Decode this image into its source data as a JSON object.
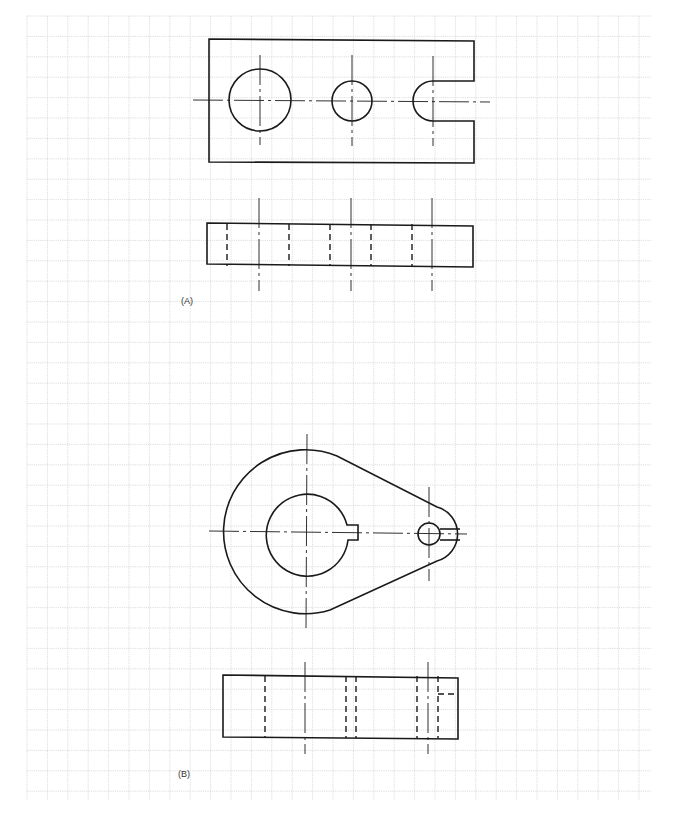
{
  "figure": {
    "labels": {
      "a": "(A)",
      "b": "(B)"
    },
    "grid": {
      "x0": 27,
      "y0": 16,
      "x1": 651,
      "y1": 800,
      "spacing": 20.4,
      "color": "#d4d4d4"
    },
    "line_color": "#1a1a1a",
    "view_a": {
      "top_view": {
        "outline": {
          "x": 209,
          "y": 39,
          "w": 265,
          "h": 124
        },
        "large_hole": {
          "cx": 260,
          "cy": 100,
          "r": 31
        },
        "medium_hole": {
          "cx": 352,
          "cy": 101,
          "r": 20
        },
        "u_slot": {
          "cx": 433,
          "cy": 101,
          "r": 20,
          "open_to_x": 474
        }
      },
      "front_view": {
        "outline": {
          "x": 207,
          "y": 223,
          "w": 266,
          "h": 43
        },
        "hidden_lines_x": [
          227,
          289,
          330,
          371,
          412
        ],
        "center_lines_x": [
          259,
          351,
          432
        ]
      }
    },
    "view_b": {
      "top_view": {
        "main_boss": {
          "cx": 307,
          "cy": 532,
          "r": 82
        },
        "bore": {
          "cx": 307,
          "cy": 532,
          "r": 41
        },
        "keyway": {
          "x": 348,
          "y": 526,
          "w": 10,
          "h": 14
        },
        "small_boss": {
          "cx": 429,
          "cy": 534,
          "r": 30
        },
        "small_hole": {
          "cx": 429,
          "cy": 534,
          "r": 11
        },
        "slit_y": [
          529,
          540
        ]
      },
      "front_view": {
        "outline": {
          "x": 223,
          "y": 675,
          "w": 235,
          "h": 63
        },
        "hidden_lines_x": [
          265,
          346,
          356,
          417,
          438
        ],
        "center_lines_x": [
          305,
          428
        ],
        "slit_hidden_y": 694
      }
    }
  }
}
